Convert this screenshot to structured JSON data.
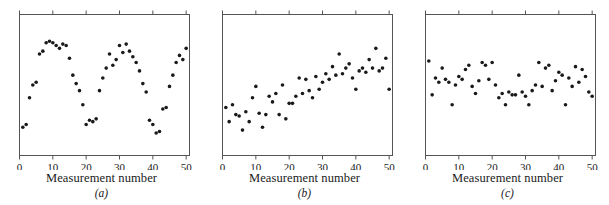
{
  "figure": {
    "background_color": "#ffffff",
    "marker_color": "#1a1a1a",
    "axis_color": "#555555"
  },
  "panels": [
    {
      "id": "a",
      "caption": "(a)",
      "xlabel": "Measurement number",
      "ticks": [
        "0",
        "10",
        "20",
        "30",
        "40",
        "50"
      ]
    },
    {
      "id": "b",
      "caption": "(b)",
      "xlabel": "Measurement number",
      "ticks": [
        "0",
        "10",
        "20",
        "30",
        "40",
        "50"
      ]
    },
    {
      "id": "c",
      "caption": "(c)",
      "xlabel": "Measurement number",
      "ticks": [
        "0",
        "10",
        "20",
        "30",
        "40",
        "50"
      ]
    }
  ],
  "chart_data": [
    {
      "type": "scatter",
      "title": "",
      "subtitle": "",
      "panel": "(a)",
      "pattern": "cyclic",
      "xlabel": "Measurement number",
      "ylabel": "",
      "xlim": [
        0,
        51
      ],
      "ylim": [
        0,
        100
      ],
      "xticks": [
        0,
        10,
        20,
        30,
        40,
        50
      ],
      "yticks": [],
      "grid": false,
      "legend": "none",
      "x": [
        1,
        2,
        3,
        4,
        5,
        6,
        7,
        8,
        9,
        10,
        11,
        12,
        13,
        14,
        15,
        16,
        17,
        18,
        19,
        20,
        21,
        22,
        23,
        24,
        25,
        26,
        27,
        28,
        29,
        30,
        31,
        32,
        33,
        34,
        35,
        36,
        37,
        38,
        39,
        40,
        41,
        42,
        43,
        44,
        45,
        46,
        47,
        48,
        49,
        50
      ],
      "y": [
        20,
        22,
        41,
        50,
        52,
        72,
        74,
        80,
        81,
        80,
        78,
        76,
        79,
        78,
        69,
        57,
        51,
        46,
        36,
        22,
        25,
        24,
        26,
        46,
        55,
        62,
        72,
        64,
        68,
        78,
        73,
        79,
        74,
        70,
        66,
        60,
        51,
        45,
        25,
        22,
        16,
        17,
        33,
        34,
        49,
        57,
        66,
        71,
        68,
        76
      ]
    },
    {
      "type": "scatter",
      "title": "",
      "subtitle": "",
      "panel": "(b)",
      "pattern": "increasing-trend",
      "xlabel": "Measurement number",
      "ylabel": "",
      "xlim": [
        0,
        51
      ],
      "ylim": [
        0,
        100
      ],
      "xticks": [
        0,
        10,
        20,
        30,
        40,
        50
      ],
      "yticks": [],
      "grid": false,
      "legend": "none",
      "x": [
        1,
        2,
        3,
        4,
        5,
        6,
        7,
        8,
        9,
        10,
        11,
        12,
        13,
        14,
        15,
        16,
        17,
        18,
        19,
        20,
        21,
        22,
        23,
        24,
        25,
        26,
        27,
        28,
        29,
        30,
        31,
        32,
        33,
        34,
        35,
        36,
        37,
        38,
        39,
        40,
        41,
        42,
        43,
        44,
        45,
        46,
        47,
        48,
        49,
        50
      ],
      "y": [
        34,
        24,
        36,
        29,
        28,
        18,
        31,
        24,
        41,
        49,
        30,
        20,
        29,
        42,
        38,
        44,
        29,
        50,
        26,
        37,
        37,
        42,
        55,
        44,
        54,
        46,
        41,
        56,
        47,
        52,
        58,
        54,
        63,
        57,
        72,
        58,
        62,
        65,
        55,
        47,
        60,
        62,
        59,
        68,
        62,
        76,
        60,
        62,
        69,
        47
      ]
    },
    {
      "type": "scatter",
      "title": "",
      "subtitle": "",
      "panel": "(c)",
      "pattern": "random",
      "xlabel": "Measurement number",
      "ylabel": "",
      "xlim": [
        0,
        51
      ],
      "ylim": [
        0,
        100
      ],
      "xticks": [
        0,
        10,
        20,
        30,
        40,
        50
      ],
      "yticks": [],
      "grid": false,
      "legend": "none",
      "x": [
        1,
        2,
        3,
        4,
        5,
        6,
        7,
        8,
        9,
        10,
        11,
        12,
        13,
        14,
        15,
        16,
        17,
        18,
        19,
        20,
        21,
        22,
        23,
        24,
        25,
        26,
        27,
        28,
        29,
        30,
        31,
        32,
        33,
        34,
        35,
        36,
        37,
        38,
        39,
        40,
        41,
        42,
        43,
        44,
        45,
        46,
        47,
        48,
        49,
        50
      ],
      "y": [
        67,
        43,
        55,
        52,
        62,
        54,
        52,
        36,
        50,
        56,
        54,
        61,
        64,
        49,
        44,
        53,
        66,
        64,
        54,
        66,
        50,
        41,
        44,
        36,
        45,
        43,
        43,
        57,
        45,
        42,
        36,
        46,
        50,
        66,
        49,
        62,
        64,
        46,
        53,
        59,
        57,
        36,
        55,
        49,
        63,
        52,
        61,
        56,
        45,
        42
      ]
    }
  ]
}
